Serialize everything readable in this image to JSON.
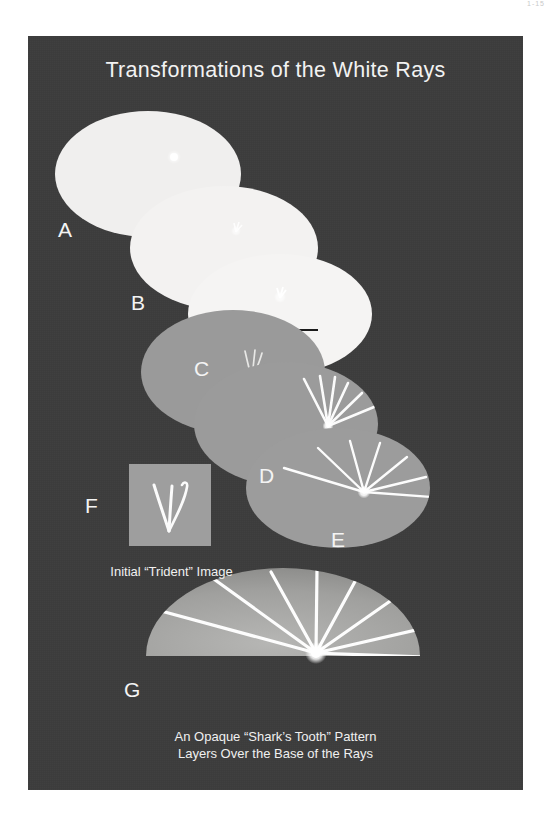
{
  "page": {
    "page_number": "1-15",
    "background_color": "#ffffff",
    "poster_background_color": "#3c3c3c"
  },
  "poster": {
    "title": "Transformations of the White Rays",
    "title_color": "#f2f2f2"
  },
  "colors": {
    "circle_white": "#f0efee",
    "circle_gray": "#9a9a9a",
    "swatch_gray": "#9e9e9e",
    "ray_white": "#fbfbfb",
    "arrow_black": "#1a1a1a",
    "label_white": "#f4f4f4",
    "dome_gray": "#a0a09e"
  },
  "panels": [
    {
      "id": "A",
      "label": "A",
      "kind": "white-circle",
      "note": "white disc with tiny bright seed dot",
      "marker": "seed-dot"
    },
    {
      "id": "B",
      "label": "B",
      "kind": "white-circle",
      "note": "white disc with small emerging trident mark",
      "marker": "small-trident"
    },
    {
      "id": "C",
      "label": "C",
      "kind": "gray-circle",
      "note": "gray disc with trident mark and left-pointing arrow above",
      "marker": "trident"
    },
    {
      "id": "D",
      "label": "D",
      "kind": "gray-circle",
      "note": "gray disc with narrow fan of white rays",
      "marker": "ray-fan-narrow",
      "ray_count": 6
    },
    {
      "id": "E",
      "label": "E",
      "kind": "gray-circle",
      "note": "gray disc with wider fan of white rays",
      "marker": "ray-fan-wide",
      "ray_count": 7
    },
    {
      "id": "F",
      "label": "F",
      "kind": "gray-square-swatch",
      "note": "gray square containing the initial trident drawing",
      "marker": "trident-large"
    },
    {
      "id": "G",
      "label": "G",
      "kind": "dome",
      "note": "semicircular opaque shark's tooth dome with full ray fan",
      "marker": "ray-fan-full",
      "ray_count": 8
    }
  ],
  "captions": {
    "trident": "Initial “Trident” Image",
    "shark_tooth_line1": "An Opaque “Shark’s Tooth” Pattern",
    "shark_tooth_line2": "Layers Over the Base of the Rays"
  },
  "annotations": {
    "arrow": {
      "name": "left-arrow",
      "direction": "left"
    }
  }
}
